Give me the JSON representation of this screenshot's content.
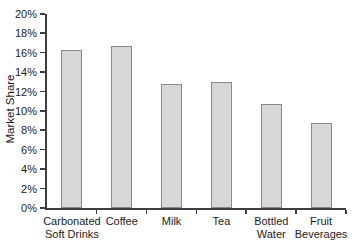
{
  "chart_data": {
    "type": "bar",
    "title": "",
    "xlabel": "",
    "ylabel": "Market Share",
    "categories": [
      "Carbonated\nSoft Drinks",
      "Coffee",
      "Milk",
      "Tea",
      "Bottled\nWater",
      "Fruit\nBeverages"
    ],
    "values": [
      16.3,
      16.7,
      12.8,
      13.0,
      10.7,
      8.8
    ],
    "ylim": [
      0,
      20
    ],
    "ytick_step": 2,
    "ytick_suffix": "%",
    "grid": false,
    "legend": false,
    "colors": {
      "background": "#ffffff",
      "axis": "#3f3f3f",
      "text": "#1c1c1c",
      "bar_fill": "#d7d7d7",
      "bar_border": "#8a8a8a"
    }
  }
}
